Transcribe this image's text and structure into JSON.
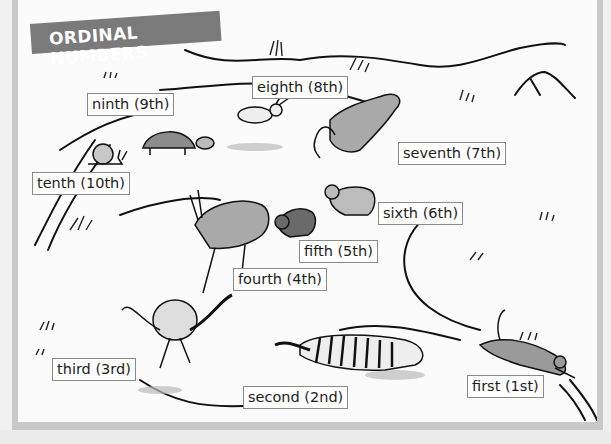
{
  "title": "ORDINAL NUMBERS",
  "labels": {
    "first": "first (1st)",
    "second": "second (2nd)",
    "third": "third (3rd)",
    "fourth": "fourth (4th)",
    "fifth": "fifth (5th)",
    "sixth": "sixth (6th)",
    "seventh": "seventh (7th)",
    "eighth": "eighth (8th)",
    "ninth": "ninth (9th)",
    "tenth": "tenth (10th)"
  },
  "animals": [
    {
      "rank": "first",
      "animal": "cheetah"
    },
    {
      "rank": "second",
      "animal": "zebra"
    },
    {
      "rank": "third",
      "animal": "ostrich"
    },
    {
      "rank": "fourth",
      "animal": "antelope"
    },
    {
      "rank": "fifth",
      "animal": "cat"
    },
    {
      "rank": "sixth",
      "animal": "dog"
    },
    {
      "rank": "seventh",
      "animal": "kangaroo"
    },
    {
      "rank": "eighth",
      "animal": "rabbit"
    },
    {
      "rank": "ninth",
      "animal": "tortoise"
    },
    {
      "rank": "tenth",
      "animal": "snail"
    }
  ],
  "colors": {
    "banner": "#7a7a7a",
    "frame": "#c9c9c9",
    "animal_fill": "#a9a9a9"
  }
}
